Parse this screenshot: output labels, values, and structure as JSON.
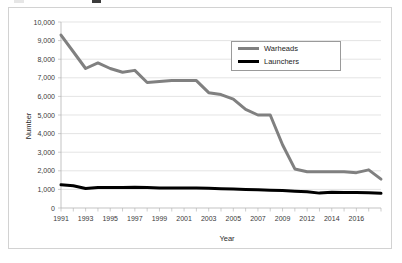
{
  "chart_data": {
    "type": "line",
    "title": "",
    "xlabel": "Year",
    "ylabel": "Number",
    "grid": true,
    "legend_position": "upper-right",
    "ylim": [
      0,
      10000
    ],
    "ytick_labels": [
      "10,000",
      "9,000",
      "8,000",
      "7,000",
      "6,000",
      "5,000",
      "4,000",
      "3,000",
      "2,000",
      "1,000",
      "0"
    ],
    "ytick_values": [
      10000,
      9000,
      8000,
      7000,
      6000,
      5000,
      4000,
      3000,
      2000,
      1000,
      0
    ],
    "xtick_labels": [
      "1991",
      "1993",
      "1995",
      "1997",
      "1999",
      "2001",
      "2003",
      "2005",
      "2007",
      "2009",
      "2012",
      "2014",
      "2016"
    ],
    "x": [
      "1991",
      "1992",
      "1993",
      "1994",
      "1995",
      "1996",
      "1997",
      "1998",
      "1999",
      "2000",
      "2001",
      "2002",
      "2003",
      "2004",
      "2005",
      "2006",
      "2007",
      "2008",
      "2009",
      "2010",
      "2011",
      "2012",
      "2013",
      "2014",
      "2015",
      "2016",
      "2017"
    ],
    "series": [
      {
        "name": "Warheads",
        "color": "#808080",
        "values": [
          9300,
          8400,
          7500,
          7800,
          7500,
          7300,
          7400,
          6750,
          6800,
          6850,
          6850,
          6850,
          6200,
          6100,
          5850,
          5300,
          5000,
          5000,
          3400,
          2100,
          1950,
          1950,
          1950,
          1950,
          1900,
          2050,
          1550
        ]
      },
      {
        "name": "Launchers",
        "color": "#000000",
        "values": [
          1250,
          1200,
          1050,
          1100,
          1100,
          1100,
          1120,
          1100,
          1080,
          1080,
          1080,
          1080,
          1060,
          1040,
          1020,
          1000,
          980,
          960,
          940,
          900,
          870,
          800,
          850,
          840,
          830,
          820,
          790
        ]
      }
    ]
  },
  "legend": {
    "entries": [
      {
        "label": "Warheads",
        "color": "#808080"
      },
      {
        "label": "Launchers",
        "color": "#000000"
      }
    ]
  },
  "axes": {
    "y_title": "Number",
    "x_title": "Year"
  }
}
